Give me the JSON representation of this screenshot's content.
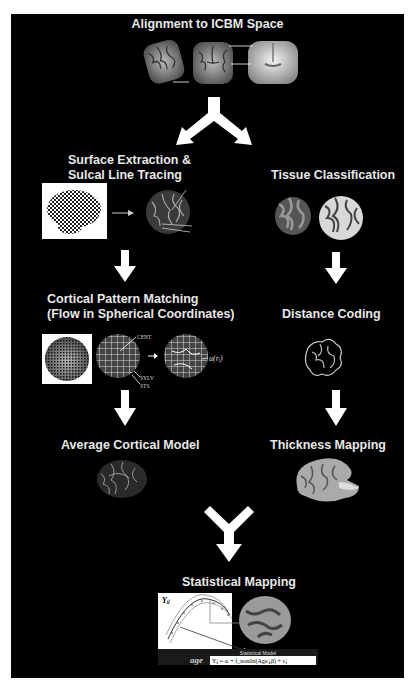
{
  "figure": {
    "background": "#000000",
    "text_color": "#e8e8e8",
    "arrow_color": "#ffffff"
  },
  "steps": {
    "alignment": {
      "title": "Alignment to ICBM Space"
    },
    "surface": {
      "title_line1": "Surface Extraction &",
      "title_line2": "Sulcal Line Tracing",
      "labels": [
        "CENT",
        "SF",
        "SYLV",
        "STS"
      ]
    },
    "tissue": {
      "title": "Tissue Classification"
    },
    "pattern": {
      "title_line1": "Cortical Pattern Matching",
      "title_line2": "(Flow in Spherical Coordinates)",
      "labels": {
        "cent": "CENT",
        "sylv": "SYLV",
        "sts": "STS",
        "flow": "u(rᵢ)"
      }
    },
    "distance": {
      "title": "Distance Coding"
    },
    "average": {
      "title": "Average Cortical Model"
    },
    "thickness": {
      "title": "Thickness Mapping"
    },
    "statistical": {
      "title": "Statistical Mapping",
      "y_axis_label": "Yᵢⱼ",
      "x_axis_label": "age",
      "model_label": "Statistical Model",
      "equation": "Yᵢⱼ = αᵢ + f_nonlin(Ageᵢⱼ,β) + εᵢⱼ"
    }
  },
  "icons": {
    "split_arrow": "fork-arrow-icon",
    "down_arrow": "down-arrow-icon",
    "merge_arrow": "merge-arrow-icon"
  }
}
